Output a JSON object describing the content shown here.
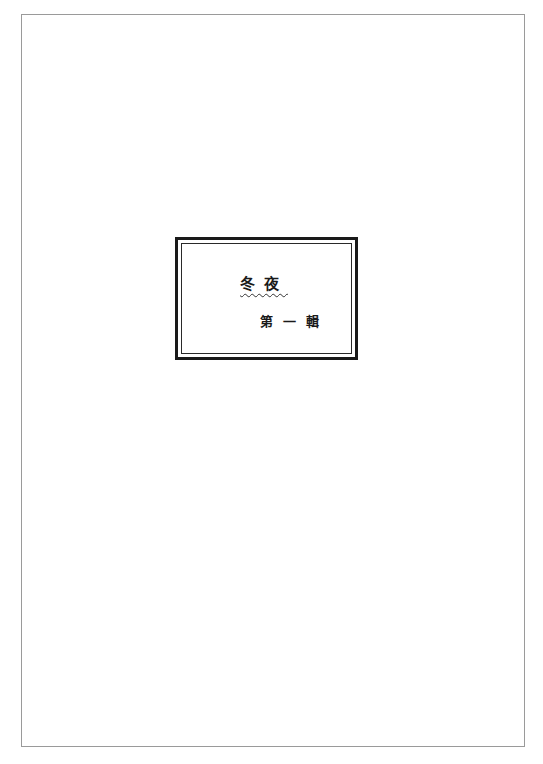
{
  "page": {
    "border_color": "#9a9a9a",
    "background": "#ffffff"
  },
  "title_box": {
    "title": "冬夜",
    "title_underline": "wavy",
    "subtitle": "第一輯"
  }
}
